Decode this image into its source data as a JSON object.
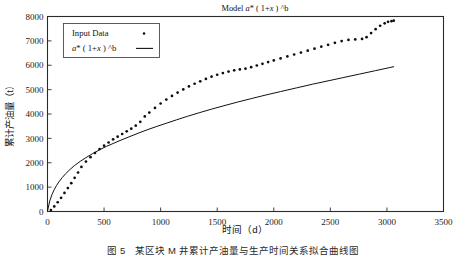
{
  "figure": {
    "caption": "图 5　某区块 M 井累计产油量与生产时间关系拟合曲线图"
  },
  "chart_data": {
    "type": "scatter",
    "title": "Model a* ( 1+x ) ^b",
    "title_parts": {
      "prefix": "Model ",
      "a": "a",
      "mid": "* ( 1+",
      "x": "x",
      "suffix": " ) ^b"
    },
    "xlabel": "时间（d）",
    "ylabel": "累计产油量（t）",
    "xlim": [
      0,
      3500
    ],
    "ylim": [
      0,
      8000
    ],
    "xticks": [
      0,
      500,
      1000,
      1500,
      2000,
      2500,
      3000,
      3500
    ],
    "yticks": [
      0,
      1000,
      2000,
      3000,
      4000,
      5000,
      6000,
      7000,
      8000
    ],
    "grid": false,
    "legend_position": "upper-left",
    "legend": [
      {
        "name": "Input Data",
        "marker": "dot"
      },
      {
        "name": "a* ( 1+x ) ^b",
        "marker": "line"
      }
    ],
    "series": [
      {
        "name": "Input Data",
        "marker": "dot",
        "color": "#0d0d0d",
        "x": [
          30,
          60,
          90,
          120,
          150,
          180,
          210,
          240,
          270,
          300,
          340,
          380,
          420,
          460,
          500,
          540,
          580,
          620,
          660,
          700,
          740,
          780,
          820,
          860,
          900,
          950,
          1000,
          1050,
          1100,
          1150,
          1200,
          1250,
          1300,
          1350,
          1400,
          1450,
          1500,
          1550,
          1600,
          1650,
          1700,
          1750,
          1800,
          1850,
          1900,
          1950,
          2000,
          2060,
          2120,
          2180,
          2240,
          2300,
          2360,
          2420,
          2480,
          2540,
          2600,
          2660,
          2720,
          2780,
          2820,
          2860,
          2900,
          2940,
          2980,
          3010,
          3040,
          3060
        ],
        "y": [
          60,
          210,
          380,
          560,
          760,
          960,
          1160,
          1380,
          1600,
          1830,
          2050,
          2230,
          2400,
          2560,
          2700,
          2830,
          2960,
          3070,
          3180,
          3290,
          3400,
          3520,
          3680,
          3900,
          4060,
          4250,
          4430,
          4590,
          4740,
          4880,
          5010,
          5130,
          5240,
          5340,
          5440,
          5530,
          5610,
          5680,
          5740,
          5790,
          5830,
          5860,
          5920,
          5990,
          6060,
          6130,
          6200,
          6280,
          6360,
          6440,
          6520,
          6600,
          6680,
          6760,
          6840,
          6920,
          6990,
          7040,
          7060,
          7080,
          7150,
          7320,
          7480,
          7620,
          7720,
          7780,
          7810,
          7830
        ]
      },
      {
        "name": "a* ( 1+x ) ^b",
        "marker": "line",
        "color": "#111111",
        "model": "a*(1+x)^b",
        "x": [
          1,
          20,
          40,
          60,
          80,
          100,
          130,
          160,
          200,
          240,
          290,
          340,
          400,
          460,
          520,
          580,
          650,
          720,
          800,
          880,
          960,
          1050,
          1140,
          1240,
          1340,
          1450,
          1560,
          1680,
          1800,
          1930,
          2060,
          2200,
          2340,
          2480,
          2620,
          2760,
          2900,
          3020,
          3060
        ],
        "y": [
          40,
          430,
          700,
          900,
          1070,
          1210,
          1390,
          1550,
          1730,
          1890,
          2060,
          2210,
          2380,
          2530,
          2670,
          2790,
          2930,
          3060,
          3210,
          3350,
          3480,
          3620,
          3760,
          3910,
          4050,
          4200,
          4340,
          4490,
          4630,
          4780,
          4920,
          5070,
          5220,
          5360,
          5500,
          5640,
          5780,
          5900,
          5940
        ]
      }
    ]
  }
}
